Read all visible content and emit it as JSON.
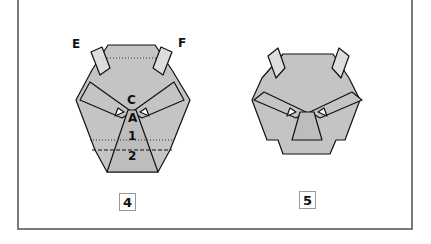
{
  "steps": [
    {
      "number": "4",
      "labels": {
        "E": "E",
        "F": "F",
        "C": "C",
        "A": "A",
        "one": "1",
        "two": "2"
      }
    },
    {
      "number": "5"
    }
  ],
  "colors": {
    "paper": "#c4c4c4",
    "frame": "#7a7a7a",
    "line": "#111111"
  }
}
